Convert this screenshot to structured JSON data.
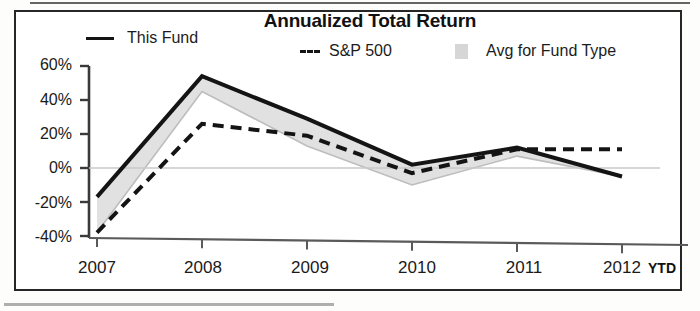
{
  "chart_data": {
    "type": "line",
    "title": "Annualized Total Return",
    "xlabel": "",
    "ylabel": "",
    "categories": [
      "2007",
      "2008",
      "2009",
      "2010",
      "2011",
      "2012"
    ],
    "x_axis_note": "YTD",
    "ylim": [
      -40,
      60
    ],
    "y_ticks": [
      60,
      40,
      20,
      0,
      -20,
      -40
    ],
    "y_tick_labels": [
      "60%",
      "40%",
      "20%",
      "0%",
      "-20%",
      "-40%"
    ],
    "grid": false,
    "zero_line": true,
    "legend_position": "top",
    "series": [
      {
        "name": "This Fund",
        "style": "solid-line",
        "color": "#141414",
        "values": [
          -17,
          54,
          29,
          2,
          12,
          -5
        ]
      },
      {
        "name": "S&P 500",
        "style": "dashed-line",
        "color": "#141414",
        "values": [
          -38,
          26,
          19,
          -3,
          11,
          11
        ]
      },
      {
        "name": "Avg for Fund Type",
        "style": "filled-area",
        "color": "#d6d6d6",
        "values": [
          -38,
          45,
          13,
          -10,
          7,
          -5
        ]
      }
    ]
  },
  "chart": {
    "title": "Annualized Total Return",
    "legend": [
      {
        "label": "This Fund",
        "marker": "solid-line-swatch"
      },
      {
        "label": "S&P 500",
        "marker": "dashed-line-swatch"
      },
      {
        "label": "Avg for Fund Type",
        "marker": "area-swatch"
      }
    ],
    "y_axis": {
      "tick_labels": [
        "60%",
        "40%",
        "20%",
        "0%",
        "-20%",
        "-40%"
      ]
    },
    "x_axis": {
      "tick_labels": [
        "2007",
        "2008",
        "2009",
        "2010",
        "2011",
        "2012"
      ],
      "suffix": "YTD"
    },
    "colors": {
      "line": "#141414",
      "area": "#d6d6d6",
      "axis": "#3a3a3a",
      "frame": "#262626",
      "text": "#1a1a1a"
    }
  }
}
